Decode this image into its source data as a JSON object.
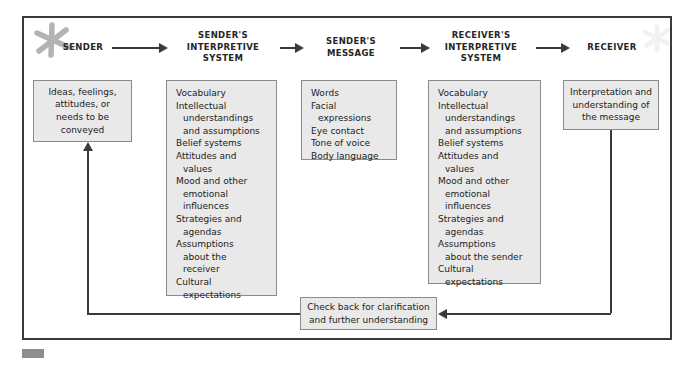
{
  "figure": {
    "frame_color": "#3a3a3a",
    "box_fill": "#e9e9e9",
    "box_border": "#8a8a8a"
  },
  "columns": [
    {
      "key": "sender",
      "heading": "SENDER",
      "box_lines": [
        {
          "text": "Ideas, feelings,",
          "indent": false
        },
        {
          "text": "attitudes, or",
          "indent": false
        },
        {
          "text": "needs to be",
          "indent": false
        },
        {
          "text": "conveyed",
          "indent": false
        }
      ]
    },
    {
      "key": "sender_interpretive_system",
      "heading": "SENDER'S\nINTERPRETIVE\nSYSTEM",
      "box_lines": [
        {
          "text": "Vocabulary",
          "indent": false
        },
        {
          "text": "Intellectual",
          "indent": false
        },
        {
          "text": "understandings",
          "indent": true
        },
        {
          "text": "and assumptions",
          "indent": true
        },
        {
          "text": "Belief systems",
          "indent": false
        },
        {
          "text": "Attitudes and",
          "indent": false
        },
        {
          "text": "values",
          "indent": true
        },
        {
          "text": "Mood and other",
          "indent": false
        },
        {
          "text": "emotional",
          "indent": true
        },
        {
          "text": "influences",
          "indent": true
        },
        {
          "text": "Strategies and",
          "indent": false
        },
        {
          "text": "agendas",
          "indent": true
        },
        {
          "text": "Assumptions",
          "indent": false
        },
        {
          "text": "about the",
          "indent": true
        },
        {
          "text": "receiver",
          "indent": true
        },
        {
          "text": "Cultural",
          "indent": false
        },
        {
          "text": "expectations",
          "indent": true
        }
      ]
    },
    {
      "key": "senders_message",
      "heading": "SENDER'S\nMESSAGE",
      "box_lines": [
        {
          "text": "Words",
          "indent": false
        },
        {
          "text": "Facial",
          "indent": false
        },
        {
          "text": "expressions",
          "indent": true
        },
        {
          "text": "Eye contact",
          "indent": false
        },
        {
          "text": "Tone of voice",
          "indent": false
        },
        {
          "text": "Body language",
          "indent": false
        }
      ]
    },
    {
      "key": "receiver_interpretive_system",
      "heading": "RECEIVER'S\nINTERPRETIVE\nSYSTEM",
      "box_lines": [
        {
          "text": "Vocabulary",
          "indent": false
        },
        {
          "text": "Intellectual",
          "indent": false
        },
        {
          "text": "understandings",
          "indent": true
        },
        {
          "text": "and assumptions",
          "indent": true
        },
        {
          "text": "Belief systems",
          "indent": false
        },
        {
          "text": "Attitudes and",
          "indent": false
        },
        {
          "text": "values",
          "indent": true
        },
        {
          "text": "Mood and other",
          "indent": false
        },
        {
          "text": "emotional",
          "indent": true
        },
        {
          "text": "influences",
          "indent": true
        },
        {
          "text": "Strategies and",
          "indent": false
        },
        {
          "text": "agendas",
          "indent": true
        },
        {
          "text": "Assumptions",
          "indent": false
        },
        {
          "text": "about the sender",
          "indent": true
        },
        {
          "text": "Cultural",
          "indent": false
        },
        {
          "text": "expectations",
          "indent": true
        }
      ]
    },
    {
      "key": "receiver",
      "heading": "RECEIVER",
      "box_lines": [
        {
          "text": "Interpretation and",
          "indent": false
        },
        {
          "text": "understanding of",
          "indent": true
        },
        {
          "text": "the message",
          "indent": true
        }
      ]
    }
  ],
  "feedback": {
    "label_lines": [
      "Check back for clarification",
      "and further understanding"
    ]
  },
  "icons": {
    "star_top_left": "star-icon",
    "star_top_right": "star-icon",
    "corner_mark": "corner-mark-icon"
  }
}
